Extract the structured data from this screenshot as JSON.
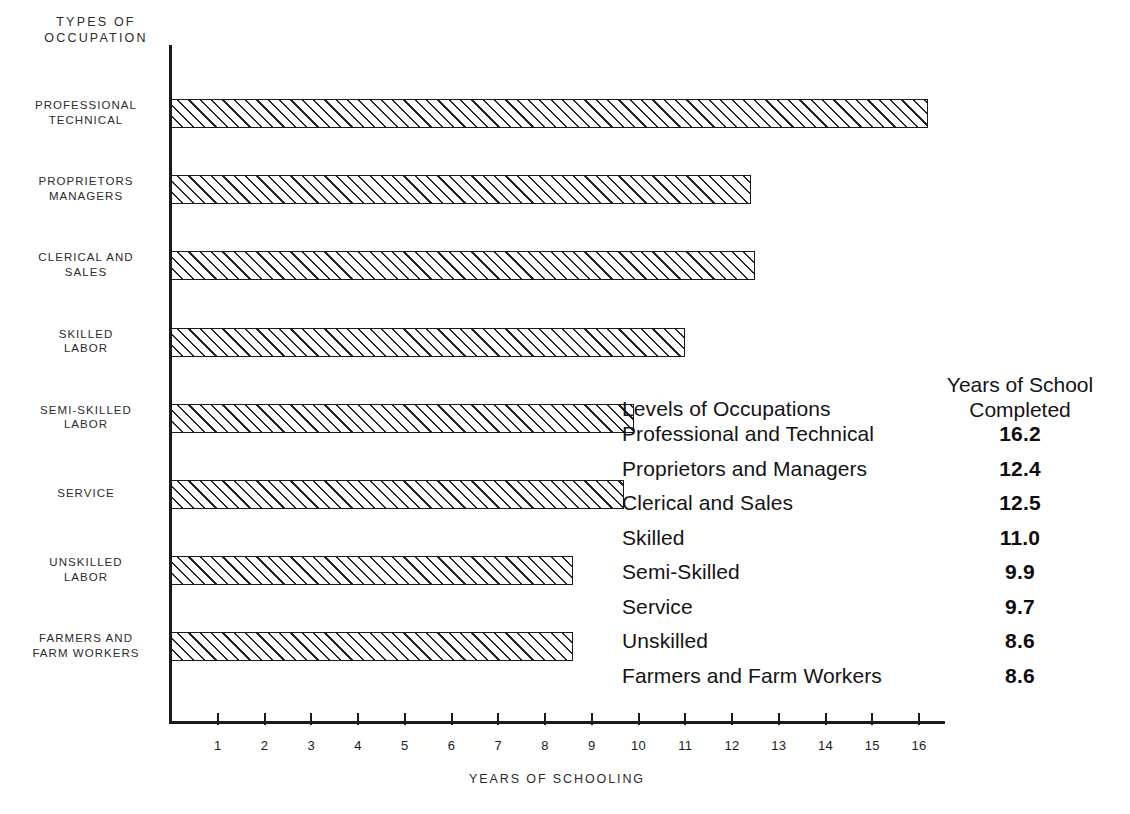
{
  "chart_data": {
    "type": "bar",
    "orientation": "horizontal",
    "title": "",
    "xlabel": "YEARS OF SCHOOLING",
    "ylabel": "TYPES OF\nOCCUPATION",
    "categories": [
      "PROFESSIONAL\nTECHNICAL",
      "PROPRIETORS\nMANAGERS",
      "CLERICAL AND\nSALES",
      "SKILLED\nLABOR",
      "SEMI-SKILLED\nLABOR",
      "SERVICE",
      "UNSKILLED\nLABOR",
      "FARMERS AND\nFARM WORKERS"
    ],
    "values": [
      16.2,
      12.4,
      12.5,
      11.0,
      9.9,
      9.7,
      8.6,
      8.6
    ],
    "xlim": [
      0,
      16.6
    ],
    "xticks": [
      1,
      2,
      3,
      4,
      5,
      6,
      7,
      8,
      9,
      10,
      11,
      12,
      13,
      14,
      15,
      16
    ],
    "xtick_labels": [
      "1",
      "2",
      "3",
      "4",
      "5",
      "6",
      "7",
      "8",
      "9",
      "10",
      "11",
      "12",
      "13",
      "14",
      "15",
      "16"
    ],
    "grid": false,
    "legend": "none",
    "bar_fill": "diagonal-hatch",
    "bar_outline_color": "#1a1a1a",
    "background_color": "#ffffff"
  },
  "table": {
    "header_left": "Levels of Occupations",
    "header_right": "Years of School\nCompleted",
    "rows": [
      {
        "name": "Professional and Technical",
        "value": "16.2"
      },
      {
        "name": "Proprietors and Managers",
        "value": "12.4"
      },
      {
        "name": "Clerical and Sales",
        "value": "12.5"
      },
      {
        "name": "Skilled",
        "value": "11.0"
      },
      {
        "name": "Semi-Skilled",
        "value": "9.9"
      },
      {
        "name": "Service",
        "value": "9.7"
      },
      {
        "name": "Unskilled",
        "value": "8.6"
      },
      {
        "name": "Farmers and Farm Workers",
        "value": "8.6"
      }
    ]
  }
}
